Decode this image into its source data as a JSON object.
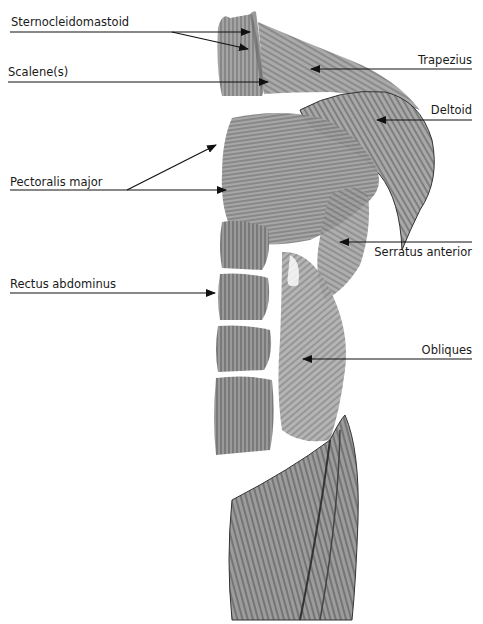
{
  "diagram": {
    "title": "",
    "line_color": "#111111",
    "muscle_fill": "#8a8a8a",
    "muscle_dark": "#4a4a4a",
    "muscle_light": "#c4c4c4",
    "labels": [
      {
        "id": "sternocleidomastoid",
        "text": "Sternocleidomastoid",
        "side": "left"
      },
      {
        "id": "scalene",
        "text": "Scalene(s)",
        "side": "left"
      },
      {
        "id": "pectoralis-major",
        "text": "Pectoralis major",
        "side": "left"
      },
      {
        "id": "rectus-abdominus",
        "text": "Rectus abdominus",
        "side": "left"
      },
      {
        "id": "trapezius",
        "text": "Trapezius",
        "side": "right"
      },
      {
        "id": "deltoid",
        "text": "Deltoid",
        "side": "right"
      },
      {
        "id": "serratus-anterior",
        "text": "Serratus anterior",
        "side": "right"
      },
      {
        "id": "obliques",
        "text": "Obliques",
        "side": "right"
      }
    ]
  }
}
